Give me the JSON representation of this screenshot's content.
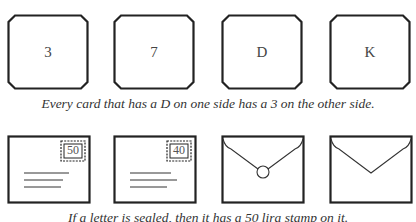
{
  "task1": {
    "cards": [
      {
        "face": "3"
      },
      {
        "face": "7"
      },
      {
        "face": "D"
      },
      {
        "face": "K"
      }
    ],
    "rule": "Every card that has a D on one side has a 3 on the other side."
  },
  "task2": {
    "envelopes": [
      {
        "side": "front",
        "stamp": "50"
      },
      {
        "side": "front",
        "stamp": "40"
      },
      {
        "side": "back",
        "sealed": true
      },
      {
        "side": "back",
        "sealed": false
      }
    ],
    "rule": "If a letter is sealed, then it has a 50 lira stamp on it."
  }
}
